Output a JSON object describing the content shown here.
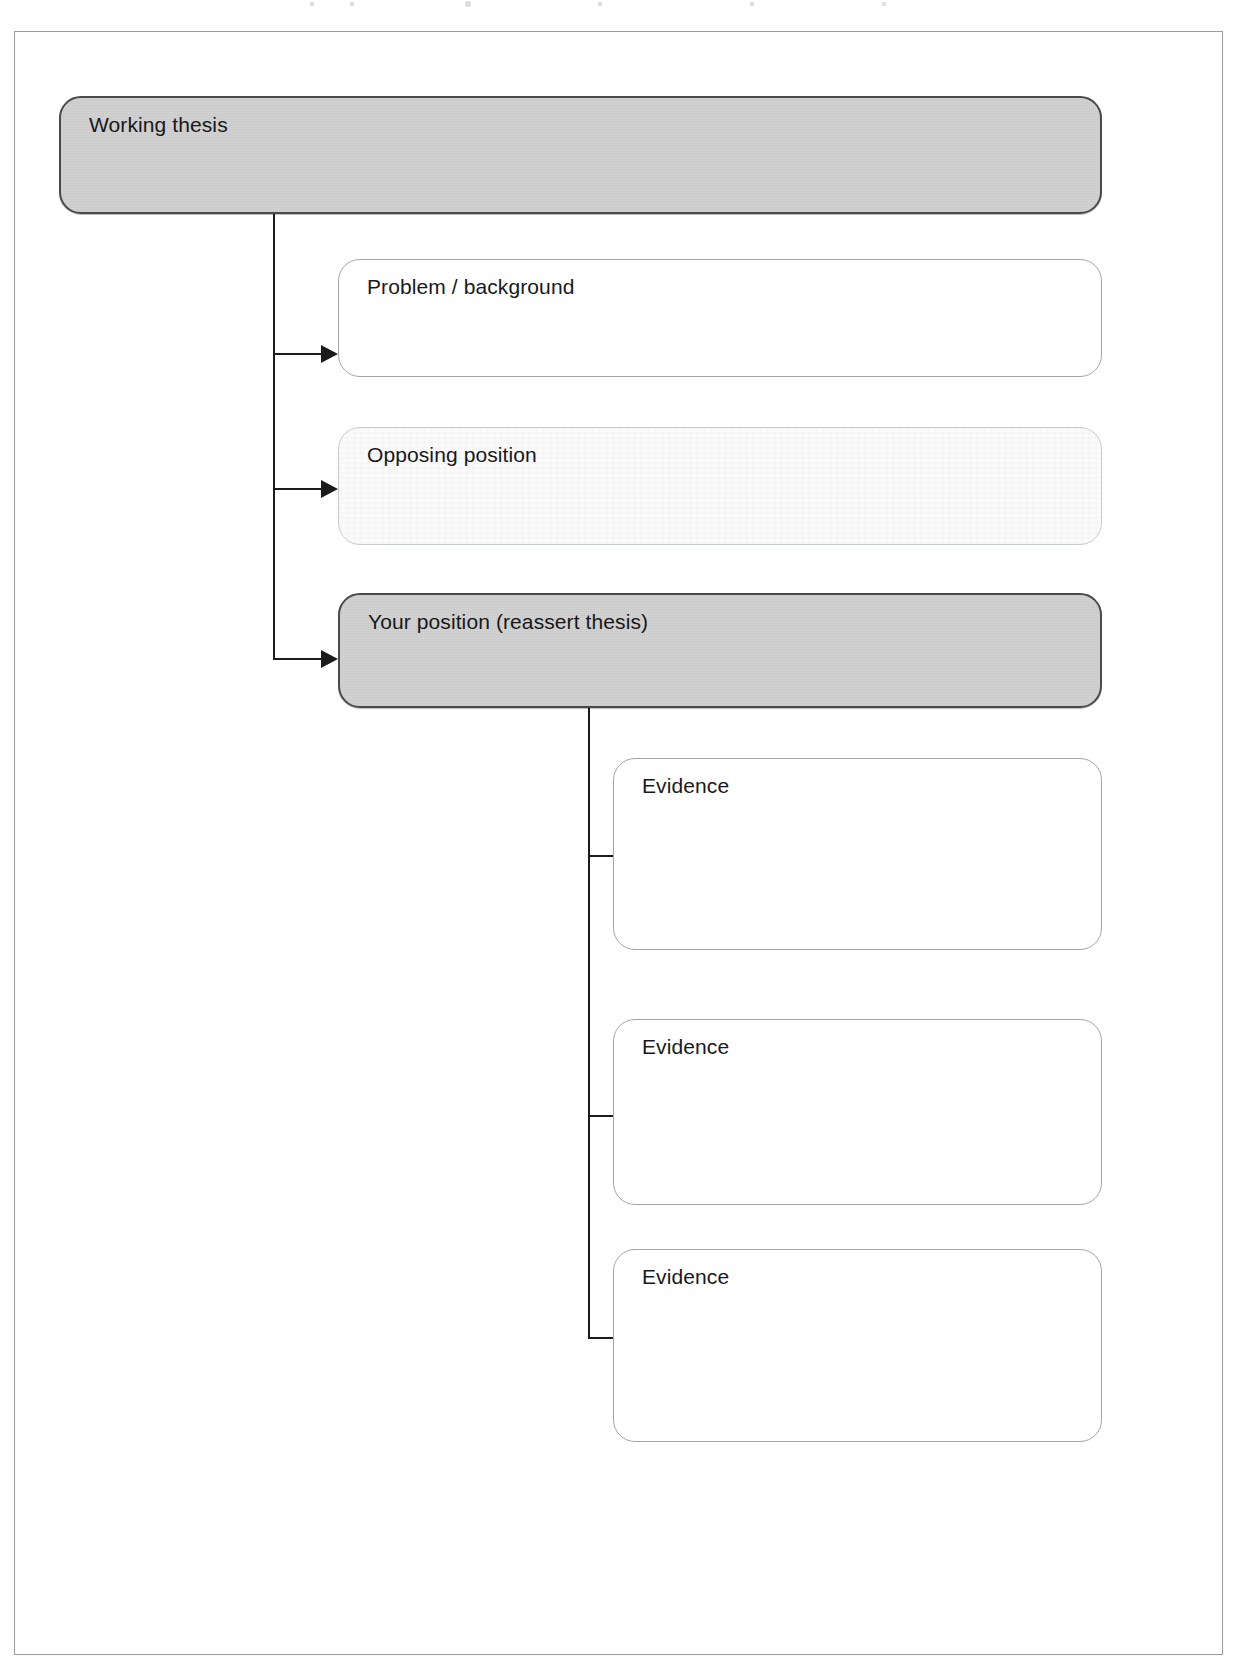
{
  "page": {
    "background_color": "#ffffff",
    "frame_border_color": "#999ea3"
  },
  "diagram_data": {
    "type": "flowchart",
    "orientation": "top-down-with-right-branches",
    "levels": 3,
    "nodes": [
      {
        "id": "working-thesis",
        "label": "Working thesis",
        "style": "filled",
        "fill": "#d4d4d4",
        "border": "#4a4a4a",
        "level": 0,
        "x": 58,
        "y": 95,
        "w": 1043,
        "h": 118
      },
      {
        "id": "problem-background",
        "label": "Problem / background",
        "style": "open",
        "fill": "#ffffff",
        "border": "#a2a6aa",
        "level": 1,
        "x": 337,
        "y": 258,
        "w": 764,
        "h": 118
      },
      {
        "id": "opposing-position",
        "label": "Opposing position",
        "style": "washed",
        "fill": "#fbfbfb",
        "border": "#c9ccd0",
        "level": 1,
        "x": 337,
        "y": 426,
        "w": 764,
        "h": 118
      },
      {
        "id": "your-position",
        "label": "Your position (reassert thesis)",
        "style": "filled",
        "fill": "#d4d4d4",
        "border": "#4a4a4a",
        "level": 1,
        "x": 337,
        "y": 592,
        "w": 764,
        "h": 115
      },
      {
        "id": "evidence-1",
        "label": "Evidence",
        "style": "open",
        "fill": "#ffffff",
        "border": "#a2a6aa",
        "level": 2,
        "x": 612,
        "y": 757,
        "w": 489,
        "h": 192
      },
      {
        "id": "evidence-2",
        "label": "Evidence",
        "style": "open",
        "fill": "#ffffff",
        "border": "#a2a6aa",
        "level": 2,
        "x": 612,
        "y": 1018,
        "w": 489,
        "h": 186
      },
      {
        "id": "evidence-3",
        "label": "Evidence",
        "style": "open",
        "fill": "#ffffff",
        "border": "#a2a6aa",
        "level": 2,
        "x": 612,
        "y": 1248,
        "w": 489,
        "h": 193
      }
    ],
    "edges": [
      {
        "from": "working-thesis",
        "to": "problem-background",
        "kind": "elbow-arrow"
      },
      {
        "from": "working-thesis",
        "to": "opposing-position",
        "kind": "elbow-arrow"
      },
      {
        "from": "working-thesis",
        "to": "your-position",
        "kind": "elbow-arrow"
      },
      {
        "from": "your-position",
        "to": "evidence-1",
        "kind": "elbow-arrow"
      },
      {
        "from": "your-position",
        "to": "evidence-2",
        "kind": "elbow-arrow"
      },
      {
        "from": "your-position",
        "to": "evidence-3",
        "kind": "elbow-arrow"
      }
    ],
    "connector_color": "#1b1b1b"
  },
  "labels": {
    "working_thesis": "Working thesis",
    "problem_background": "Problem / background",
    "opposing_position": "Opposing position",
    "your_position": "Your position (reassert thesis)",
    "evidence_1": "Evidence",
    "evidence_2": "Evidence",
    "evidence_3": "Evidence"
  }
}
